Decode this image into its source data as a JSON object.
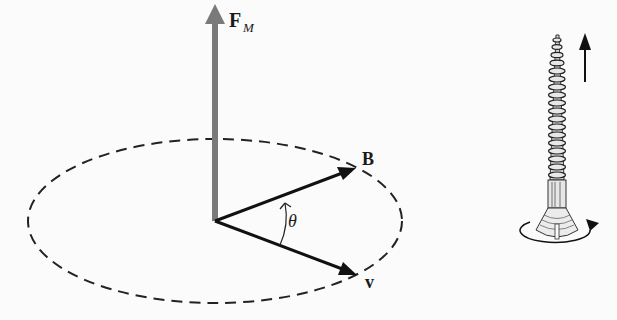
{
  "diagram": {
    "left_panel": {
      "force_vector": {
        "label_main": "F",
        "label_sub": "M",
        "color": "#7a7a7a"
      },
      "field_vector": {
        "label": "B",
        "color": "#111111"
      },
      "velocity_vector": {
        "label": "v",
        "color": "#111111"
      },
      "angle": {
        "label": "θ"
      },
      "orbit": {
        "style": "dashed ellipse",
        "color": "#222222"
      }
    },
    "right_panel": {
      "object": "screw",
      "translation_arrow": "up",
      "rotation_arrow": "counterclockwise"
    }
  }
}
